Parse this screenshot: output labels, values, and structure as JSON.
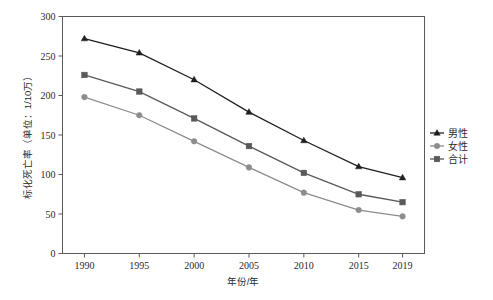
{
  "chart_data": {
    "type": "line",
    "title": "",
    "xlabel": "年份/年",
    "ylabel": "标化死亡率（单位：1/10万）",
    "categories": [
      1990,
      1995,
      2000,
      2005,
      2010,
      2015,
      2019
    ],
    "xtick_labels": [
      "1990",
      "1995",
      "2000",
      "2005",
      "2010",
      "2015",
      "2019"
    ],
    "ytick_labels": [
      "0",
      "50",
      "100",
      "150",
      "200",
      "250",
      "300"
    ],
    "ytick_values": [
      0,
      50,
      100,
      150,
      200,
      250,
      300
    ],
    "ylim": [
      0,
      300
    ],
    "xlim": [
      1988,
      2021
    ],
    "grid": false,
    "legend_position": "right",
    "series": [
      {
        "name": "男性",
        "marker": "triangle",
        "color": "#1f1f1f",
        "values": [
          272,
          254,
          220,
          179,
          143,
          110,
          96
        ]
      },
      {
        "name": "女性",
        "marker": "circle",
        "color": "#8c8c8c",
        "values": [
          198,
          175,
          142,
          109,
          77,
          55,
          47
        ]
      },
      {
        "name": "合计",
        "marker": "square",
        "color": "#595959",
        "values": [
          226,
          205,
          171,
          136,
          102,
          75,
          65
        ]
      }
    ]
  },
  "legend": {
    "items": [
      {
        "label": "男性",
        "marker": "triangle",
        "color": "#1f1f1f"
      },
      {
        "label": "女性",
        "marker": "circle",
        "color": "#8c8c8c"
      },
      {
        "label": "合计",
        "marker": "square",
        "color": "#595959"
      }
    ]
  },
  "colors": {
    "male": "#1f1f1f",
    "female": "#8c8c8c",
    "total": "#595959",
    "axis": "#5a5a5a",
    "text": "#2b2b2b",
    "background": "#ffffff"
  }
}
